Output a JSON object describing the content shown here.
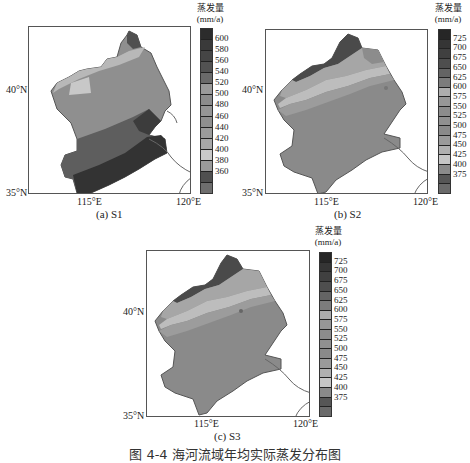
{
  "figure_caption": "图 4-4  海河流域年均实际蒸发分布图",
  "colorbar_title_line1": "蒸发量",
  "colorbar_title_line2": "(mm/a)",
  "axis": {
    "lat_top": "40°N",
    "lat_bottom": "35°N",
    "lon_left": "115°E",
    "lon_right": "120°E"
  },
  "panels": [
    {
      "id": "a",
      "caption": "(a) S1",
      "colorbar_ticks": [
        "600",
        "580",
        "560",
        "540",
        "520",
        "500",
        "480",
        "460",
        "440",
        "420",
        "400",
        "380",
        "360"
      ],
      "colorbar_colors": [
        "#2c2c2c",
        "#3a3a3a",
        "#454545",
        "#525252",
        "#6a6a6a",
        "#9a9a9a",
        "#8c8c8c",
        "#959595",
        "#8f8f8f",
        "#9c9c9c",
        "#a8a8a8",
        "#c9c9c9",
        "#9a9a9a",
        "#505050",
        "#6e6e6e"
      ]
    },
    {
      "id": "b",
      "caption": "(b) S2",
      "colorbar_ticks": [
        "725",
        "700",
        "675",
        "650",
        "625",
        "600",
        "575",
        "550",
        "525",
        "500",
        "475",
        "450",
        "425",
        "400",
        "375"
      ],
      "colorbar_colors": [
        "#262626",
        "#353535",
        "#404040",
        "#4e4e4e",
        "#646464",
        "#7c7c7c",
        "#adadad",
        "#979797",
        "#8c8c8c",
        "#909090",
        "#8a8a8a",
        "#9a9a9a",
        "#b0b0b0",
        "#c6c6c6",
        "#8a8a8a",
        "#565656",
        "#6a6a6a"
      ]
    },
    {
      "id": "c",
      "caption": "(c) S3",
      "colorbar_ticks": [
        "725",
        "700",
        "675",
        "650",
        "625",
        "600",
        "575",
        "550",
        "525",
        "500",
        "475",
        "450",
        "425",
        "400",
        "375"
      ],
      "colorbar_colors": [
        "#262626",
        "#353535",
        "#404040",
        "#4e4e4e",
        "#646464",
        "#7c7c7c",
        "#adadad",
        "#979797",
        "#8c8c8c",
        "#909090",
        "#8a8a8a",
        "#9a9a9a",
        "#b0b0b0",
        "#c6c6c6",
        "#8a8a8a",
        "#565656",
        "#6a6a6a"
      ]
    }
  ]
}
